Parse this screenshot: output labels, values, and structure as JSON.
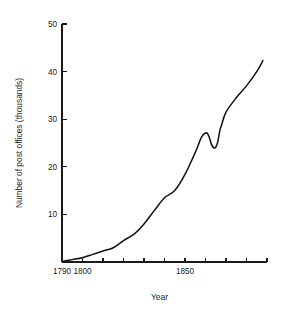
{
  "chart_data": {
    "type": "line",
    "title": "",
    "xlabel": "Year",
    "ylabel": "Number of post offices (thousands)",
    "xlim": [
      1790,
      1890
    ],
    "ylim": [
      0,
      50
    ],
    "grid": false,
    "legend": null,
    "x_tick_values": [
      1790,
      1800,
      1810,
      1820,
      1830,
      1840,
      1850,
      1860,
      1870,
      1880,
      1890
    ],
    "x_tick_labels": [
      "1790",
      "1800",
      "",
      "",
      "",
      "",
      "1850",
      "",
      "",
      "",
      ""
    ],
    "y_tick_values": [
      10,
      20,
      30,
      40,
      50
    ],
    "y_tick_labels": [
      "10",
      "20",
      "30",
      "40",
      "50"
    ],
    "series": [
      {
        "name": "Number of post offices",
        "x": [
          1790,
          1795,
          1800,
          1805,
          1810,
          1815,
          1820,
          1825,
          1830,
          1835,
          1840,
          1845,
          1850,
          1855,
          1858,
          1860,
          1861,
          1862,
          1863,
          1864,
          1865,
          1866,
          1867,
          1868,
          1870,
          1875,
          1880,
          1885,
          1888
        ],
        "values": [
          0.1,
          0.5,
          0.9,
          1.6,
          2.3,
          3.0,
          4.5,
          5.8,
          8.0,
          10.8,
          13.5,
          15.0,
          18.4,
          23.0,
          26.2,
          27.1,
          27.0,
          26.0,
          24.6,
          24.0,
          24.1,
          25.3,
          27.6,
          29.0,
          31.5,
          34.5,
          37.0,
          40.0,
          42.3
        ]
      }
    ],
    "annotations": []
  },
  "figure": {
    "plot_left_px": 62,
    "plot_right_px": 267,
    "plot_bottom_px": 262,
    "plot_top_px": 24,
    "axis_color": "#1a1a1a",
    "curve_color": "#101010",
    "background_color": "#ffffff"
  }
}
